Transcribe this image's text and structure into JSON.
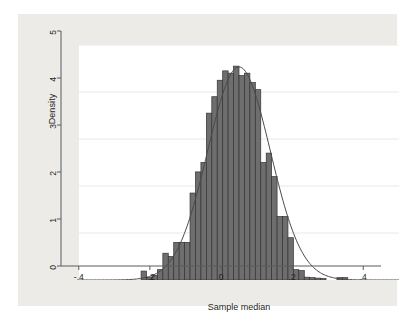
{
  "figure": {
    "background_color": "#ffffff",
    "graph_region_color": "#ecebe7",
    "plot_background_color": "#ffffff",
    "bar_fill_color": "#6e6e6e",
    "bar_edge_color": "#333333",
    "curve_color": "#4a4a4a",
    "axis_color": "#5a5a5a",
    "grid_color": "#e8e8e8"
  },
  "chart_data": {
    "type": "bar",
    "title": "",
    "subtitle": "",
    "xlabel": "Sample median",
    "ylabel": "Density",
    "xlim": [
      -0.45,
      0.45
    ],
    "ylim": [
      0,
      5
    ],
    "xticks": [
      -0.4,
      -0.2,
      0,
      0.2,
      0.4
    ],
    "xtick_labels": [
      "-.4",
      "-.2",
      "0",
      ".2",
      ".4"
    ],
    "yticks": [
      0,
      1,
      2,
      3,
      4,
      5
    ],
    "ytick_labels": [
      "0",
      "1",
      "2",
      "3",
      "4",
      "5"
    ],
    "grid": true,
    "grid_axis": "y",
    "legend": false,
    "legend_position": "none",
    "bin_width": 0.0153,
    "bin_left_edges": [
      -0.2754,
      -0.2601,
      -0.2448,
      -0.2295,
      -0.2142,
      -0.1989,
      -0.1836,
      -0.1683,
      -0.153,
      -0.1377,
      -0.1224,
      -0.1071,
      -0.0918,
      -0.0765,
      -0.0612,
      -0.0459,
      -0.0306,
      -0.0153,
      0.0,
      0.0153,
      0.0306,
      0.0459,
      0.0612,
      0.0765,
      0.0918,
      0.1071,
      0.1224,
      0.1377,
      0.153,
      0.1683,
      0.1836,
      0.1989,
      0.2142,
      0.2295,
      0.2754,
      0.2907
    ],
    "values": [
      0.19,
      0.05,
      0.1,
      0.22,
      0.57,
      0.5,
      0.8,
      0.8,
      0.8,
      1.85,
      2.3,
      2.5,
      3.55,
      3.9,
      4.25,
      4.45,
      4.4,
      4.55,
      4.35,
      4.4,
      4.2,
      4.05,
      2.5,
      2.7,
      2.2,
      1.35,
      1.35,
      0.9,
      0.22,
      0.2,
      0.06,
      0.05,
      0.04,
      0.03,
      0.05,
      0.05
    ],
    "overlay_curve": {
      "type": "line",
      "name": "normal density",
      "mean": 0.0,
      "sd": 0.088,
      "peak": 4.53
    }
  }
}
